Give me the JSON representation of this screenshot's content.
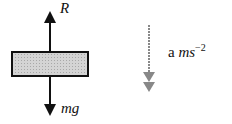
{
  "diagram": {
    "force_up_label": "R",
    "force_down_label": "mg",
    "acceleration": {
      "prefix": "a",
      "unit": "ms",
      "exponent": "−2"
    },
    "colors": {
      "block_fill": "#c8c8c8",
      "outline": "#111111",
      "accel_arrow": "#888888"
    }
  }
}
